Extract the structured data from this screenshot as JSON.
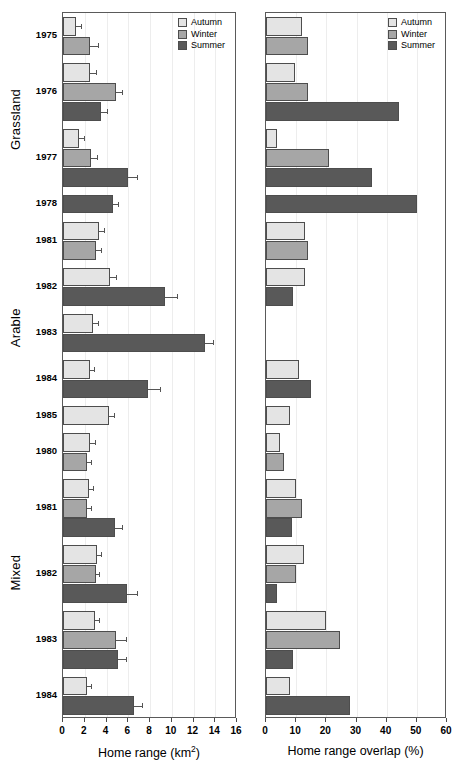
{
  "figure": {
    "panels": [
      {
        "name": "home-range",
        "axis_title": "Home range (km",
        "axis_title_sup": "2",
        "axis_title_tail": ")",
        "xlim": [
          0,
          16
        ],
        "ticks": [
          0,
          2,
          4,
          6,
          8,
          10,
          12,
          14,
          16
        ]
      },
      {
        "name": "home-range-overlap",
        "axis_title": "Home range overlap (%)",
        "axis_title_sup": "",
        "axis_title_tail": "",
        "xlim": [
          0,
          60
        ],
        "ticks": [
          0,
          10,
          20,
          30,
          40,
          50,
          60
        ]
      }
    ],
    "legend": {
      "position": "top-right",
      "items": [
        {
          "label": "Autumn",
          "color": "#e4e4e4"
        },
        {
          "label": "Winter",
          "color": "#a6a6a6"
        },
        {
          "label": "Summer",
          "color": "#595959"
        }
      ]
    },
    "habitat_groups": [
      {
        "label": "Grassland",
        "years": [
          "1975",
          "1976",
          "1977",
          "1978"
        ]
      },
      {
        "label": "Arable",
        "years": [
          "1981",
          "1982",
          "1983",
          "1984",
          "1985"
        ]
      },
      {
        "label": "Mixed",
        "years": [
          "1980",
          "1981",
          "1982",
          "1983",
          "1984"
        ]
      }
    ]
  },
  "chart_data": {
    "type": "bar",
    "orientation": "horizontal",
    "title": "",
    "grid": "vertical-light",
    "legend": [
      "Autumn",
      "Winter",
      "Summer"
    ],
    "series_colors": {
      "Autumn": "#e4e4e4",
      "Winter": "#a6a6a6",
      "Summer": "#595959"
    },
    "panels": [
      {
        "name": "home_range",
        "xlabel": "Home range (km2)",
        "xlim": [
          0,
          16
        ],
        "xticks": [
          0,
          2,
          4,
          6,
          8,
          10,
          12,
          14,
          16
        ],
        "units": "km2"
      },
      {
        "name": "home_range_overlap",
        "xlabel": "Home range overlap (%)",
        "xlim": [
          0,
          60
        ],
        "xticks": [
          0,
          10,
          20,
          30,
          40,
          50,
          60
        ],
        "units": "%"
      }
    ],
    "groups": [
      {
        "habitat": "Grassland",
        "rows": [
          {
            "year": "1975",
            "bars": [
              {
                "season": "Autumn",
                "home_range": 1.2,
                "home_range_err": 0.45,
                "overlap": 12.0
              },
              {
                "season": "Winter",
                "home_range": 2.5,
                "home_range_err": 0.7,
                "overlap": 14.0
              }
            ]
          },
          {
            "year": "1976",
            "bars": [
              {
                "season": "Autumn",
                "home_range": 2.5,
                "home_range_err": 0.55,
                "overlap": 9.5
              },
              {
                "season": "Winter",
                "home_range": 4.9,
                "home_range_err": 0.55,
                "overlap": 14.0
              },
              {
                "season": "Summer",
                "home_range": 3.5,
                "home_range_err": 0.5,
                "overlap": 44.0
              }
            ]
          },
          {
            "year": "1977",
            "bars": [
              {
                "season": "Autumn",
                "home_range": 1.5,
                "home_range_err": 0.4,
                "overlap": 3.5
              },
              {
                "season": "Winter",
                "home_range": 2.6,
                "home_range_err": 0.5,
                "overlap": 21.0
              },
              {
                "season": "Summer",
                "home_range": 6.0,
                "home_range_err": 0.8,
                "overlap": 35.0
              }
            ]
          },
          {
            "year": "1978",
            "bars": [
              {
                "season": "Summer",
                "home_range": 4.6,
                "home_range_err": 0.45,
                "overlap": 50.0
              }
            ]
          }
        ]
      },
      {
        "habitat": "Arable",
        "rows": [
          {
            "year": "1981",
            "bars": [
              {
                "season": "Autumn",
                "home_range": 3.3,
                "home_range_err": 0.5,
                "overlap": 13.0
              },
              {
                "season": "Winter",
                "home_range": 3.0,
                "home_range_err": 0.45,
                "overlap": 14.0
              }
            ]
          },
          {
            "year": "1982",
            "bars": [
              {
                "season": "Autumn",
                "home_range": 4.3,
                "home_range_err": 0.6,
                "overlap": 13.0
              },
              {
                "season": "Summer",
                "home_range": 9.4,
                "home_range_err": 1.1,
                "overlap": 9.0
              }
            ]
          },
          {
            "year": "1983",
            "bars": [
              {
                "season": "Autumn",
                "home_range": 2.8,
                "home_range_err": 0.4,
                "overlap": 0
              },
              {
                "season": "Summer",
                "home_range": 13.1,
                "home_range_err": 0.7,
                "overlap": 0
              }
            ]
          },
          {
            "year": "1984",
            "bars": [
              {
                "season": "Autumn",
                "home_range": 2.5,
                "home_range_err": 0.35,
                "overlap": 11.0
              },
              {
                "season": "Summer",
                "home_range": 7.8,
                "home_range_err": 1.1,
                "overlap": 15.0
              }
            ]
          },
          {
            "year": "1985",
            "bars": [
              {
                "season": "Autumn",
                "home_range": 4.2,
                "home_range_err": 0.45,
                "overlap": 8.0
              }
            ]
          }
        ]
      },
      {
        "habitat": "Mixed",
        "rows": [
          {
            "year": "1980",
            "bars": [
              {
                "season": "Autumn",
                "home_range": 2.5,
                "home_range_err": 0.4,
                "overlap": 4.5
              },
              {
                "season": "Winter",
                "home_range": 2.2,
                "home_range_err": 0.35,
                "overlap": 6.0
              }
            ]
          },
          {
            "year": "1981",
            "bars": [
              {
                "season": "Autumn",
                "home_range": 2.4,
                "home_range_err": 0.4,
                "overlap": 10.0
              },
              {
                "season": "Winter",
                "home_range": 2.2,
                "home_range_err": 0.4,
                "overlap": 12.0
              },
              {
                "season": "Summer",
                "home_range": 4.8,
                "home_range_err": 0.6,
                "overlap": 8.5
              }
            ]
          },
          {
            "year": "1982",
            "bars": [
              {
                "season": "Autumn",
                "home_range": 3.1,
                "home_range_err": 0.35,
                "overlap": 12.5
              },
              {
                "season": "Winter",
                "home_range": 3.0,
                "home_range_err": 0.35,
                "overlap": 10.0
              },
              {
                "season": "Summer",
                "home_range": 5.9,
                "home_range_err": 0.9,
                "overlap": 3.5
              }
            ]
          },
          {
            "year": "1983",
            "bars": [
              {
                "season": "Autumn",
                "home_range": 2.9,
                "home_range_err": 0.4,
                "overlap": 20.0
              },
              {
                "season": "Winter",
                "home_range": 4.9,
                "home_range_err": 0.9,
                "overlap": 24.5
              },
              {
                "season": "Summer",
                "home_range": 5.1,
                "home_range_err": 0.7,
                "overlap": 9.0
              }
            ]
          },
          {
            "year": "1984",
            "bars": [
              {
                "season": "Autumn",
                "home_range": 2.2,
                "home_range_err": 0.35,
                "overlap": 8.0
              },
              {
                "season": "Summer",
                "home_range": 6.5,
                "home_range_err": 0.8,
                "overlap": 28.0
              }
            ]
          }
        ]
      }
    ]
  }
}
